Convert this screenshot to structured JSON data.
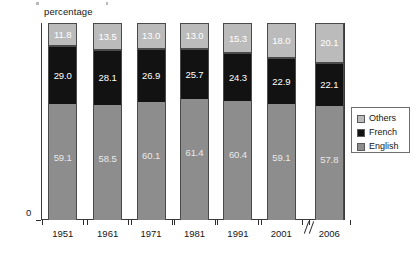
{
  "chart": {
    "axis_unit_label": "percentage",
    "zero_label": "0",
    "axis_break_symbol": "//"
  },
  "legend": {
    "items": [
      {
        "label": "Others",
        "color": "#bbbbbb"
      },
      {
        "label": "French",
        "color": "#121212"
      },
      {
        "label": "English",
        "color": "#8d8d8d"
      }
    ]
  },
  "chart_data": {
    "type": "bar",
    "stacked": true,
    "title": "",
    "subtitle": "",
    "xlabel": "",
    "ylabel": "percentage",
    "ylim": [
      0,
      100
    ],
    "ytick_labels": [
      "100",
      "90",
      "80",
      "70",
      "60",
      "50",
      "40",
      "30",
      "20",
      "10",
      "0"
    ],
    "yticks": [
      100,
      90,
      80,
      70,
      60,
      50,
      40,
      30,
      20,
      10,
      0
    ],
    "grid": false,
    "legend_position": "right",
    "axis_break_after_category": "2001",
    "categories": [
      "1951",
      "1961",
      "1971",
      "1981",
      "1991",
      "2001",
      "2006"
    ],
    "series": [
      {
        "name": "English",
        "color": "#8d8d8d",
        "values": [
          59.1,
          58.5,
          60.1,
          61.4,
          60.4,
          59.1,
          57.8
        ]
      },
      {
        "name": "French",
        "color": "#121212",
        "values": [
          29.0,
          28.1,
          26.9,
          25.7,
          24.3,
          22.9,
          22.1
        ]
      },
      {
        "name": "Others",
        "color": "#bbbbbb",
        "values": [
          11.8,
          13.5,
          13.0,
          13.0,
          15.3,
          18.0,
          20.1
        ]
      }
    ]
  }
}
